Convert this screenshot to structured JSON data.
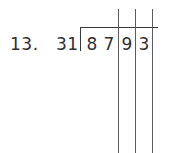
{
  "problem": {
    "number_label": "13.",
    "divisor": "31",
    "dividend": "8793",
    "dividend_digits": [
      "8",
      "7",
      "9",
      "3"
    ],
    "operation": "long-division"
  },
  "rules": {
    "count": 3,
    "labels": [
      "column-rule-1",
      "column-rule-2",
      "column-rule-3"
    ]
  },
  "colors": {
    "background": "#ffffff",
    "ink": "#2f2f33",
    "rule": "#5a5a60",
    "bracket": "#3a3a3e"
  }
}
